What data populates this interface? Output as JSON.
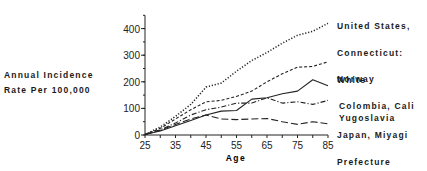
{
  "chart_data": {
    "type": "line",
    "title": "",
    "xlabel": "Age",
    "ylabel": "Annual Incidence Rate Per 100,000",
    "ylabel_lines": [
      "Annual Incidence",
      "Rate Per 100,000"
    ],
    "xlim": [
      25,
      85
    ],
    "ylim": [
      0,
      450
    ],
    "xticks": [
      25,
      35,
      45,
      55,
      65,
      75,
      85
    ],
    "yticks": [
      0,
      100,
      200,
      300,
      400
    ],
    "grid": false,
    "legend_position": "right, inline labels at line ends",
    "x": [
      25,
      30,
      35,
      40,
      45,
      50,
      55,
      60,
      65,
      70,
      75,
      80,
      85
    ],
    "series": [
      {
        "name": "United States, Connecticut: White",
        "label_lines": [
          "United States,",
          "Connecticut:",
          "White"
        ],
        "style": "dotted",
        "values": [
          2,
          30,
          70,
          115,
          180,
          195,
          240,
          280,
          310,
          345,
          375,
          390,
          420
        ]
      },
      {
        "name": "Norway",
        "label_lines": [
          "Norway"
        ],
        "style": "short-dash",
        "values": [
          2,
          25,
          60,
          95,
          125,
          130,
          145,
          165,
          200,
          230,
          255,
          258,
          275
        ]
      },
      {
        "name": "Colombia, Cali",
        "label_lines": [
          "Colombia, Cali"
        ],
        "style": "solid",
        "values": [
          2,
          15,
          35,
          55,
          75,
          90,
          92,
          135,
          140,
          155,
          165,
          208,
          185
        ]
      },
      {
        "name": "Yugoslavia",
        "label_lines": [
          "Yugoslavia"
        ],
        "style": "dash-dot",
        "values": [
          2,
          20,
          45,
          75,
          95,
          105,
          120,
          120,
          140,
          120,
          125,
          115,
          130
        ]
      },
      {
        "name": "Japan, Miyagi Prefecture",
        "label_lines": [
          "Japan, Miyagi",
          "Prefecture"
        ],
        "style": "long-dash",
        "values": [
          2,
          18,
          40,
          60,
          75,
          60,
          58,
          60,
          62,
          50,
          40,
          50,
          42
        ]
      }
    ]
  }
}
